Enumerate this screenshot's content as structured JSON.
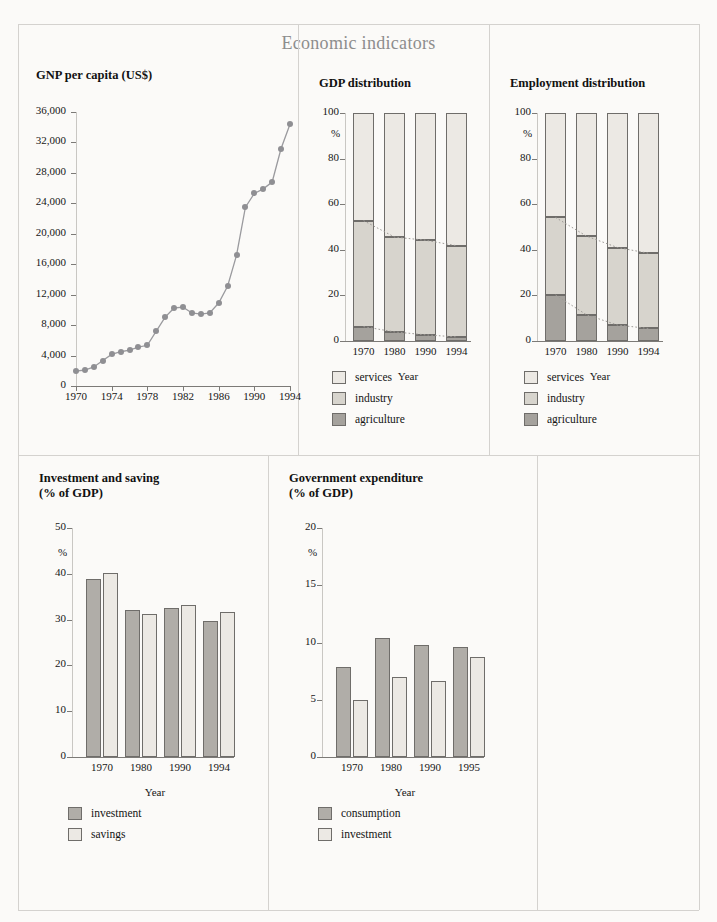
{
  "page": {
    "title": "Economic indicators",
    "background_color": "#fbfaf8",
    "divider_color": "#d4d2cf"
  },
  "palette": {
    "services": "#ece9e4",
    "industry": "#d7d4cd",
    "agriculture": "#a5a29d",
    "investment": "#b0ada8",
    "savings": "#ece9e4",
    "consumption": "#b0ada8",
    "gov_investment": "#ece9e4",
    "line_marker": "#8f8f93",
    "line_stroke": "#9a9a9e",
    "axis": "#c9c7c3",
    "tick": "#7c7a77",
    "bar_border": "#6f6d6a",
    "trend_dotted": "#9d9a96"
  },
  "charts": [
    {
      "id": "gnp-per-capita",
      "title": "GNP per capita (US$)"
    },
    {
      "id": "gdp-distribution",
      "title": "GDP distribution"
    },
    {
      "id": "employment-distribution",
      "title": "Employment distribution"
    },
    {
      "id": "investment-and-saving",
      "title": "Investment and saving\n(% of GDP)"
    },
    {
      "id": "government-expenditure",
      "title": "Government expenditure\n(% of GDP)"
    }
  ],
  "chart_data": [
    {
      "id": "gnp-per-capita",
      "type": "line",
      "title": "GNP per capita (US$)",
      "xlabel": "Year",
      "ylabel": "",
      "grid": false,
      "legend": null,
      "xlim": [
        1970,
        1994
      ],
      "ylim": [
        0,
        36000
      ],
      "ytick_labels": [
        "0",
        "4,000",
        "8,000",
        "12,000",
        "16,000",
        "20,000",
        "24,000",
        "28,000",
        "32,000",
        "36,000"
      ],
      "yticks": [
        0,
        4000,
        8000,
        12000,
        16000,
        20000,
        24000,
        28000,
        32000,
        36000
      ],
      "xtick_labels": [
        "1970",
        "1974",
        "1978",
        "1982",
        "1986",
        "1990",
        "1994"
      ],
      "xticks": [
        1970,
        1974,
        1978,
        1982,
        1986,
        1990,
        1994
      ],
      "x": [
        1970,
        1971,
        1972,
        1973,
        1974,
        1975,
        1976,
        1977,
        1978,
        1979,
        1980,
        1981,
        1982,
        1983,
        1984,
        1985,
        1986,
        1987,
        1988,
        1989,
        1990,
        1991,
        1992,
        1993,
        1994
      ],
      "values": [
        1950,
        2100,
        2500,
        3350,
        4150,
        4500,
        4700,
        5100,
        5350,
        7200,
        9050,
        10250,
        10350,
        9600,
        9450,
        9600,
        10900,
        13100,
        17150,
        23500,
        25300,
        25900,
        26800,
        31200,
        34400
      ]
    },
    {
      "id": "gdp-distribution",
      "type": "bar",
      "subtype": "stacked",
      "title": "GDP distribution",
      "xlabel": "Year",
      "ylabel": "%",
      "ylim": [
        0,
        100
      ],
      "yticks": [
        0,
        20,
        40,
        60,
        80,
        100
      ],
      "ytick_labels": [
        "0",
        "20",
        "40",
        "60",
        "80",
        "100"
      ],
      "categories": [
        "1970",
        "1980",
        "1990",
        "1994"
      ],
      "series": [
        {
          "name": "agriculture",
          "values": [
            6.3,
            4.0,
            2.7,
            1.8
          ]
        },
        {
          "name": "industry",
          "values": [
            46.5,
            41.6,
            41.5,
            40.0
          ]
        },
        {
          "name": "services",
          "values": [
            47.2,
            54.4,
            55.8,
            58.2
          ]
        }
      ],
      "cumulative_tops": [
        {
          "name": "agriculture_top",
          "values": [
            6.3,
            4.0,
            2.7,
            1.8
          ]
        },
        {
          "name": "industry_top",
          "values": [
            52.8,
            45.6,
            44.2,
            41.8
          ]
        }
      ],
      "trend_lines": [
        "agriculture_top",
        "industry_top"
      ],
      "legend": [
        "services",
        "industry",
        "agriculture"
      ],
      "legend_position": "below"
    },
    {
      "id": "employment-distribution",
      "type": "bar",
      "subtype": "stacked",
      "title": "Employment distribution",
      "xlabel": "Year",
      "ylabel": "%",
      "ylim": [
        0,
        100
      ],
      "yticks": [
        0,
        20,
        40,
        60,
        80,
        100
      ],
      "ytick_labels": [
        "0",
        "20",
        "40",
        "60",
        "80",
        "100"
      ],
      "categories": [
        "1970",
        "1980",
        "1990",
        "1994"
      ],
      "series": [
        {
          "name": "agriculture",
          "values": [
            20.2,
            11.5,
            7.0,
            5.5
          ]
        },
        {
          "name": "industry",
          "values": [
            34.0,
            34.5,
            34.0,
            33.0
          ]
        },
        {
          "name": "services",
          "values": [
            45.8,
            54.0,
            59.0,
            61.5
          ]
        }
      ],
      "cumulative_tops": [
        {
          "name": "agriculture_top",
          "values": [
            20.2,
            11.5,
            7.0,
            5.5
          ]
        },
        {
          "name": "industry_top",
          "values": [
            54.2,
            46.0,
            41.0,
            38.5
          ]
        }
      ],
      "trend_lines": [
        "agriculture_top",
        "industry_top"
      ],
      "legend": [
        "services",
        "industry",
        "agriculture"
      ],
      "legend_position": "below"
    },
    {
      "id": "investment-and-saving",
      "type": "bar",
      "subtype": "grouped",
      "title": "Investment and saving (% of GDP)",
      "xlabel": "Year",
      "ylabel": "%",
      "ylim": [
        0,
        50
      ],
      "yticks": [
        0,
        10,
        20,
        30,
        40,
        50
      ],
      "ytick_labels": [
        "0",
        "10",
        "20",
        "30",
        "40",
        "50"
      ],
      "categories": [
        "1970",
        "1980",
        "1990",
        "1994"
      ],
      "series": [
        {
          "name": "investment",
          "values": [
            38.9,
            32.0,
            32.5,
            29.7
          ]
        },
        {
          "name": "savings",
          "values": [
            40.2,
            31.3,
            33.2,
            31.6
          ]
        }
      ],
      "legend": [
        "investment",
        "savings"
      ],
      "legend_position": "below"
    },
    {
      "id": "government-expenditure",
      "type": "bar",
      "subtype": "grouped",
      "title": "Government expenditure (% of GDP)",
      "xlabel": "Year",
      "ylabel": "%",
      "ylim": [
        0,
        20
      ],
      "yticks": [
        0,
        5,
        10,
        15,
        20
      ],
      "ytick_labels": [
        "0",
        "5",
        "10",
        "15",
        "20"
      ],
      "categories": [
        "1970",
        "1980",
        "1990",
        "1995"
      ],
      "series": [
        {
          "name": "consumption",
          "values": [
            7.9,
            10.4,
            9.8,
            9.6
          ]
        },
        {
          "name": "investment",
          "values": [
            5.0,
            7.0,
            6.6,
            8.7
          ]
        }
      ],
      "legend": [
        "consumption",
        "investment"
      ],
      "legend_position": "below"
    }
  ],
  "labels": {
    "year": "Year",
    "percent": "%"
  }
}
